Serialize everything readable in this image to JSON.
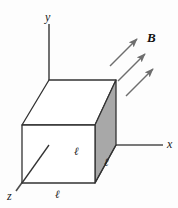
{
  "figure": {
    "background_color": "#fdfdfd",
    "width": 178,
    "height": 208
  },
  "axes": {
    "stroke_color": "#4d4d4d",
    "labels": {
      "x": "x",
      "y": "y",
      "z": "z"
    },
    "origin": {
      "x": 95,
      "y": 145
    },
    "x_axis": {
      "from": {
        "x": 95,
        "y": 145
      },
      "to": {
        "x": 163,
        "y": 145
      }
    },
    "y_axis": {
      "from": {
        "x": 49,
        "y": 24
      },
      "to": {
        "x": 49,
        "y": 183
      }
    },
    "z_axis": {
      "from": {
        "x": 49,
        "y": 145
      },
      "to": {
        "x": 16,
        "y": 191
      }
    },
    "label_positions": {
      "x": {
        "x": 167,
        "y": 139
      },
      "y": {
        "x": 45,
        "y": 11
      },
      "z": {
        "x": 8,
        "y": 191
      }
    }
  },
  "cube": {
    "edge_label": "ℓ",
    "edge_label_count": 3,
    "face_fill_shaded": "#a8a8a8",
    "face_fill_plain": "#ffffff",
    "edge_stroke": "#333333",
    "hidden_edge_style": "dashed",
    "vertices": {
      "front_bottom_left": {
        "x": 22,
        "y": 183
      },
      "front_bottom_right": {
        "x": 95,
        "y": 183
      },
      "front_top_left": {
        "x": 22,
        "y": 125
      },
      "front_top_right": {
        "x": 95,
        "y": 125
      },
      "back_bottom_left": {
        "x": 49,
        "y": 145
      },
      "back_bottom_right": {
        "x": 116,
        "y": 145
      },
      "back_top_left": {
        "x": 49,
        "y": 80
      },
      "back_top_right": {
        "x": 116,
        "y": 80
      }
    },
    "edge_labels": [
      {
        "text": "ℓ",
        "x": 55,
        "y": 189,
        "edge": "bottom-front"
      },
      {
        "text": "ℓ",
        "x": 74,
        "y": 146,
        "edge": "bottom-depth"
      },
      {
        "text": "ℓ",
        "x": 104,
        "y": 157,
        "edge": "right-depth"
      }
    ]
  },
  "magnetic_field": {
    "label": "B",
    "label_position": {
      "x": 147,
      "y": 31
    },
    "arrow_color": "#6e6e6e",
    "arrow_count": 3,
    "direction_degrees": 45,
    "arrows": [
      {
        "x1": 110,
        "y1": 66,
        "x2": 139,
        "y2": 37
      },
      {
        "x1": 116,
        "y1": 80,
        "x2": 145,
        "y2": 51
      },
      {
        "x1": 124,
        "y1": 95,
        "x2": 153,
        "y2": 66
      }
    ]
  }
}
